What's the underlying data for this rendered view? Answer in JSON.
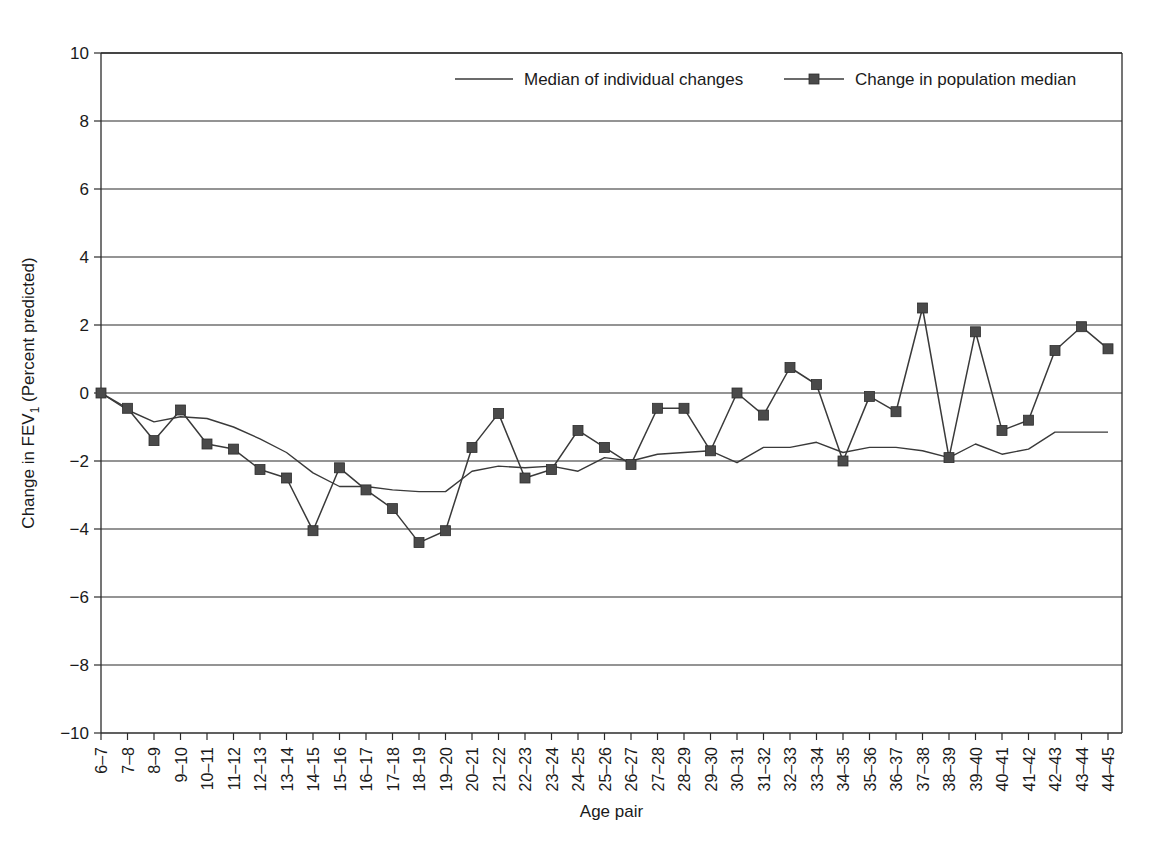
{
  "chart_data": {
    "type": "line",
    "title": "",
    "xlabel": "Age pair",
    "ylabel": "Change in FEV₁ (Percent predicted)",
    "ylabel_main": "Change in FEV",
    "ylabel_sub": "1",
    "ylabel_tail": " (Percent predicted)",
    "ylim": [
      -10,
      10
    ],
    "ytick_values": [
      10,
      8,
      6,
      4,
      2,
      0,
      -2,
      -4,
      -6,
      -8,
      -10
    ],
    "ytick_labels": [
      "10",
      "8",
      "6",
      "4",
      "2",
      "0",
      "−2",
      "−4",
      "−6",
      "−8",
      "−10"
    ],
    "grid": "horizontal",
    "legend_position": "top-center",
    "categories": [
      "6–7",
      "7–8",
      "8–9",
      "9–10",
      "10–11",
      "11–12",
      "12–13",
      "13–14",
      "14–15",
      "15–16",
      "16–17",
      "17–18",
      "18–19",
      "19–20",
      "20–21",
      "21–22",
      "22–23",
      "23–24",
      "24–25",
      "25–26",
      "26–27",
      "27–28",
      "28–29",
      "29–30",
      "30–31",
      "31–32",
      "32–33",
      "33–34",
      "34–35",
      "35–36",
      "36–37",
      "37–38",
      "38–39",
      "39–40",
      "40–41",
      "41–42",
      "42–43",
      "43–44",
      "44–45"
    ],
    "series": [
      {
        "name": "Median of individual changes",
        "marker": "none",
        "color": "#3a3a3a",
        "values": [
          0,
          -0.5,
          -0.85,
          -0.7,
          -0.75,
          -1.0,
          -1.35,
          -1.75,
          -2.35,
          -2.75,
          -2.75,
          -2.85,
          -2.9,
          -2.9,
          -2.3,
          -2.15,
          -2.2,
          -2.15,
          -2.3,
          -1.9,
          -2.0,
          -1.8,
          -1.75,
          -1.7,
          -2.05,
          -1.6,
          -1.6,
          -1.45,
          -1.75,
          -1.6,
          -1.6,
          -1.7,
          -1.9,
          -1.5,
          -1.8,
          -1.65,
          -1.15,
          -1.15,
          -1.15
        ]
      },
      {
        "name": "Change in population median",
        "marker": "square",
        "color": "#4a4a4a",
        "values": [
          0,
          -0.45,
          -1.4,
          -0.5,
          -1.5,
          -1.65,
          -2.25,
          -2.5,
          -4.05,
          -2.2,
          -2.85,
          -3.4,
          -4.4,
          -4.05,
          -1.6,
          -0.6,
          -2.5,
          -2.25,
          -1.1,
          -1.6,
          -2.1,
          -0.45,
          -0.45,
          -1.7,
          0.0,
          -0.65,
          0.75,
          0.25,
          -2.0,
          -0.1,
          -0.55,
          2.5,
          -1.9,
          1.8,
          -1.1,
          -0.8,
          1.25,
          1.95,
          1.3
        ]
      }
    ]
  },
  "legend": {
    "items": [
      {
        "label": "Median of individual changes",
        "style": "line"
      },
      {
        "label": "Change in population median",
        "style": "line-marker"
      }
    ]
  }
}
